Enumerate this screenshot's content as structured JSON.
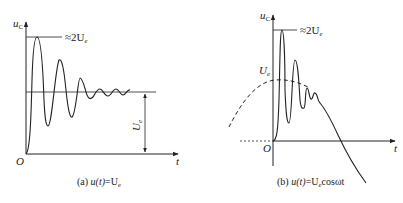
{
  "panels": [
    {
      "id": "a",
      "y_axis_label": "u",
      "y_axis_sub": "C",
      "x_axis_label": "t",
      "origin_label": "O",
      "peak_label": "≈2U",
      "peak_label_sub": "e",
      "steady_label": "U",
      "steady_label_sub": "e",
      "caption_prefix": "(a) ",
      "caption_func": "u(t)",
      "caption_eq": "=U",
      "caption_sub": "e",
      "caption_suffix": ""
    },
    {
      "id": "b",
      "y_axis_label": "u",
      "y_axis_sub": "C",
      "x_axis_label": "t",
      "origin_label": "O",
      "peak_label": "≈2U",
      "peak_label_sub": "e",
      "amp_label": "U",
      "amp_label_sub": "e",
      "caption_prefix": "(b) ",
      "caption_func": "u(t)",
      "caption_eq": "=U",
      "caption_sub": "e",
      "caption_suffix": "cosωt"
    }
  ],
  "colors": {
    "stroke": "#222222",
    "background": "#ffffff"
  }
}
